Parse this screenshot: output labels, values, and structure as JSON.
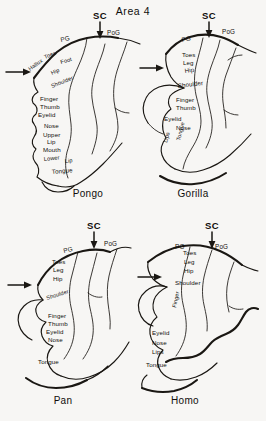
{
  "figure": {
    "title": "Area 4",
    "background_color": "#f7f6f4",
    "ink_color": "#1a1713"
  },
  "annotations": {
    "sulcus_label": "SC",
    "precentral_gyrus": "PG",
    "postcentral_gyrus": "PoG",
    "arrow_icon": "down-arrow-icon",
    "side_arrow_icon": "right-arrow-icon"
  },
  "panels": [
    {
      "id": "pongo",
      "caption": "Pongo",
      "sulcus_label": "SC",
      "pg_label": "PG",
      "pog_label": "PoG",
      "body_labels": [
        {
          "text": "Toes",
          "x": 45,
          "y": 59,
          "rot": -22,
          "size": "sm"
        },
        {
          "text": "Foot",
          "x": 61,
          "y": 64,
          "rot": -16,
          "size": "sm"
        },
        {
          "text": "Hallux",
          "x": 30,
          "y": 71,
          "rot": -36,
          "size": "sm"
        },
        {
          "text": "Hip",
          "x": 52,
          "y": 75,
          "rot": -25,
          "size": "sm"
        },
        {
          "text": "Shoulder",
          "x": 52,
          "y": 88,
          "rot": -22,
          "size": "sm"
        },
        {
          "text": "Finger",
          "x": 40,
          "y": 101,
          "rot": 0,
          "size": "md"
        },
        {
          "text": "Thumb",
          "x": 40,
          "y": 109,
          "rot": 0,
          "size": "md"
        },
        {
          "text": "Eyelid",
          "x": 38,
          "y": 117,
          "rot": 0,
          "size": "md"
        },
        {
          "text": "Nose",
          "x": 44,
          "y": 128,
          "rot": 0,
          "size": "md"
        },
        {
          "text": "Upper",
          "x": 43,
          "y": 137,
          "rot": 0,
          "size": "md"
        },
        {
          "text": "Lip",
          "x": 47,
          "y": 144,
          "rot": 0,
          "size": "md"
        },
        {
          "text": "Mouth",
          "x": 43,
          "y": 152,
          "rot": 0,
          "size": "md"
        },
        {
          "text": "Lower",
          "x": 44,
          "y": 161,
          "rot": -6,
          "size": "sm"
        },
        {
          "text": "Lip",
          "x": 65,
          "y": 163,
          "rot": -6,
          "size": "sm"
        },
        {
          "text": "Tongue",
          "x": 52,
          "y": 174,
          "rot": -5,
          "size": "md"
        }
      ]
    },
    {
      "id": "gorilla",
      "caption": "Gorilla",
      "sulcus_label": "SC",
      "pg_label": "PG",
      "pog_label": "PoG",
      "body_labels": [
        {
          "text": "Toes",
          "x": 182,
          "y": 57,
          "rot": 0,
          "size": "md"
        },
        {
          "text": "Leg",
          "x": 183,
          "y": 65,
          "rot": 0,
          "size": "md"
        },
        {
          "text": "Hip",
          "x": 185,
          "y": 73,
          "rot": -8,
          "size": "md"
        },
        {
          "text": "Shoulder",
          "x": 178,
          "y": 88,
          "rot": -7,
          "size": "md"
        },
        {
          "text": "Finger",
          "x": 176,
          "y": 102,
          "rot": 0,
          "size": "md"
        },
        {
          "text": "Thumb",
          "x": 176,
          "y": 110,
          "rot": 0,
          "size": "md"
        },
        {
          "text": "Eyelid",
          "x": 164,
          "y": 121,
          "rot": 0,
          "size": "md"
        },
        {
          "text": "Nose",
          "x": 176,
          "y": 130,
          "rot": 0,
          "size": "md"
        },
        {
          "text": "Lips",
          "x": 167,
          "y": 143,
          "rot": -75,
          "size": "sm"
        },
        {
          "text": "Tongue",
          "x": 180,
          "y": 141,
          "rot": -76,
          "size": "sm"
        }
      ]
    },
    {
      "id": "pan",
      "caption": "Pan",
      "sulcus_label": "SC",
      "pg_label": "PG",
      "pog_label": "PoG",
      "body_labels": [
        {
          "text": "Toes",
          "x": 52,
          "y": 264,
          "rot": 0,
          "size": "md"
        },
        {
          "text": "Leg",
          "x": 53,
          "y": 272,
          "rot": 0,
          "size": "md"
        },
        {
          "text": "Hip",
          "x": 53,
          "y": 281,
          "rot": 0,
          "size": "md"
        },
        {
          "text": "Shoulder",
          "x": 47,
          "y": 300,
          "rot": -18,
          "size": "sm"
        },
        {
          "text": "Finger",
          "x": 48,
          "y": 318,
          "rot": 0,
          "size": "md"
        },
        {
          "text": "Thumb",
          "x": 48,
          "y": 326,
          "rot": 0,
          "size": "md"
        },
        {
          "text": "Eyelid",
          "x": 46,
          "y": 334,
          "rot": 0,
          "size": "md"
        },
        {
          "text": "Nose",
          "x": 48,
          "y": 342,
          "rot": 0,
          "size": "md"
        },
        {
          "text": "Tongue",
          "x": 38,
          "y": 364,
          "rot": 0,
          "size": "md"
        }
      ]
    },
    {
      "id": "homo",
      "caption": "Homo",
      "sulcus_label": "SC",
      "pg_label": "PG",
      "pog_label": "PoG",
      "body_labels": [
        {
          "text": "Toes",
          "x": 183,
          "y": 255,
          "rot": 0,
          "size": "md"
        },
        {
          "text": "Leg",
          "x": 184,
          "y": 264,
          "rot": 0,
          "size": "md"
        },
        {
          "text": "Hip",
          "x": 184,
          "y": 273,
          "rot": 0,
          "size": "md"
        },
        {
          "text": "Shoulder",
          "x": 175,
          "y": 285,
          "rot": 0,
          "size": "md"
        },
        {
          "text": "Finger",
          "x": 176,
          "y": 308,
          "rot": -78,
          "size": "sm"
        },
        {
          "text": "Eyelid",
          "x": 152,
          "y": 335,
          "rot": 0,
          "size": "md"
        },
        {
          "text": "Nose",
          "x": 152,
          "y": 345,
          "rot": 0,
          "size": "md"
        },
        {
          "text": "Lips",
          "x": 152,
          "y": 354,
          "rot": 0,
          "size": "md"
        },
        {
          "text": "Tongue",
          "x": 146,
          "y": 367,
          "rot": 0,
          "size": "md"
        }
      ]
    }
  ]
}
